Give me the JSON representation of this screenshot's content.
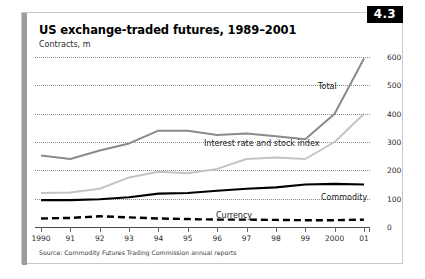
{
  "figure": {
    "badge": "4.3",
    "title": "US exchange-traded futures, 1989–2001",
    "subtitle": "Contracts, m",
    "source": "Source: Commodity Futures Trading Commission annual reports"
  },
  "colors": {
    "total": "#8a8a8a",
    "interest_rate_and_stock_index": "#c4c4c4",
    "commodity": "#000000",
    "currency": "#000000",
    "gridline": "#8c8c8c",
    "axis": "#4a4a4a",
    "badge_background": "#000000",
    "badge_text": "#ffffff",
    "accent_bar": "#9d9d9d",
    "panel_border": "#c9c9c9"
  },
  "labels": {
    "total": "Total",
    "interest_rate_and_stock_index": "Interest rate and stock index",
    "commodity": "Commodity",
    "currency": "Currency"
  },
  "chart_data": {
    "type": "line",
    "title": "US exchange-traded futures, 1989–2001",
    "subtitle": "Contracts, m",
    "xlabel": "",
    "ylabel": "Contracts, m",
    "ylim": [
      0,
      600
    ],
    "yticks": [
      0,
      100,
      200,
      300,
      400,
      500,
      600
    ],
    "ytick_labels": [
      "0",
      "100",
      "200",
      "300",
      "400",
      "500",
      "600"
    ],
    "y_axis_position": "right",
    "grid": true,
    "grid_style": "dotted-horizontal",
    "legend": "inline-annotations",
    "categories": [
      "1990",
      "91",
      "92",
      "93",
      "94",
      "95",
      "96",
      "97",
      "98",
      "99",
      "2000",
      "01"
    ],
    "x": [
      1990,
      1991,
      1992,
      1993,
      1994,
      1995,
      1996,
      1997,
      1998,
      1999,
      2000,
      2001
    ],
    "series": [
      {
        "name": "Total",
        "color": "#8a8a8a",
        "style": "solid",
        "values": [
          252,
          240,
          270,
          295,
          340,
          340,
          325,
          330,
          320,
          310,
          400,
          595
        ]
      },
      {
        "name": "Interest rate and stock index",
        "color": "#c4c4c4",
        "style": "solid",
        "values": [
          120,
          122,
          135,
          175,
          195,
          190,
          205,
          240,
          245,
          240,
          300,
          400
        ]
      },
      {
        "name": "Commodity",
        "color": "#000000",
        "style": "solid",
        "values": [
          95,
          95,
          98,
          105,
          118,
          120,
          128,
          135,
          140,
          150,
          152,
          150
        ]
      },
      {
        "name": "Currency",
        "color": "#000000",
        "style": "dashed",
        "values": [
          30,
          32,
          38,
          34,
          30,
          28,
          26,
          26,
          25,
          24,
          24,
          26
        ]
      }
    ]
  }
}
